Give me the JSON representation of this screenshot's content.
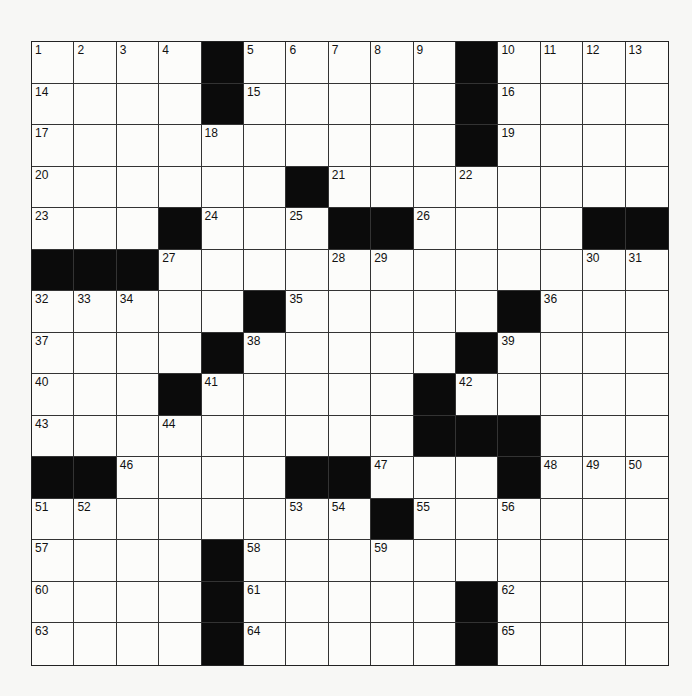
{
  "puzzle": {
    "size": 15,
    "colors": {
      "black": "#0b0b0b",
      "white": "#fcfcfa",
      "line": "#333333"
    },
    "rows": [
      "....#.....#....",
      "....#.....#....",
      "..........#....",
      "......#........",
      "...#...##....##",
      "###............",
      ".....#.....#...",
      "....#.....#....",
      "...#.....#.....",
      ".........###...",
      "##....##...#...",
      "........#......",
      "....#..........",
      "....#.....#....",
      "....#.....#...."
    ],
    "numbers": [
      [
        1,
        2,
        3,
        4,
        0,
        5,
        6,
        7,
        8,
        9,
        0,
        10,
        11,
        12,
        13
      ],
      [
        14,
        0,
        0,
        0,
        0,
        15,
        0,
        0,
        0,
        0,
        0,
        16,
        0,
        0,
        0
      ],
      [
        17,
        0,
        0,
        0,
        18,
        0,
        0,
        0,
        0,
        0,
        0,
        19,
        0,
        0,
        0
      ],
      [
        20,
        0,
        0,
        0,
        0,
        0,
        0,
        21,
        0,
        0,
        22,
        0,
        0,
        0,
        0
      ],
      [
        23,
        0,
        0,
        0,
        24,
        0,
        25,
        0,
        0,
        26,
        0,
        0,
        0,
        0,
        0
      ],
      [
        0,
        0,
        0,
        27,
        0,
        0,
        0,
        28,
        29,
        0,
        0,
        0,
        0,
        30,
        31
      ],
      [
        32,
        33,
        34,
        0,
        0,
        0,
        35,
        0,
        0,
        0,
        0,
        0,
        36,
        0,
        0
      ],
      [
        37,
        0,
        0,
        0,
        0,
        38,
        0,
        0,
        0,
        0,
        0,
        39,
        0,
        0,
        0
      ],
      [
        40,
        0,
        0,
        0,
        41,
        0,
        0,
        0,
        0,
        0,
        42,
        0,
        0,
        0,
        0
      ],
      [
        43,
        0,
        0,
        44,
        0,
        0,
        0,
        0,
        0,
        45,
        0,
        0,
        0,
        0,
        0
      ],
      [
        0,
        0,
        46,
        0,
        0,
        0,
        0,
        0,
        47,
        0,
        0,
        0,
        48,
        49,
        50
      ],
      [
        51,
        52,
        0,
        0,
        0,
        0,
        53,
        54,
        0,
        55,
        0,
        56,
        0,
        0,
        0
      ],
      [
        57,
        0,
        0,
        0,
        0,
        58,
        0,
        0,
        59,
        0,
        0,
        0,
        0,
        0,
        0
      ],
      [
        60,
        0,
        0,
        0,
        0,
        61,
        0,
        0,
        0,
        0,
        0,
        62,
        0,
        0,
        0
      ],
      [
        63,
        0,
        0,
        0,
        0,
        64,
        0,
        0,
        0,
        0,
        0,
        65,
        0,
        0,
        0
      ]
    ]
  }
}
